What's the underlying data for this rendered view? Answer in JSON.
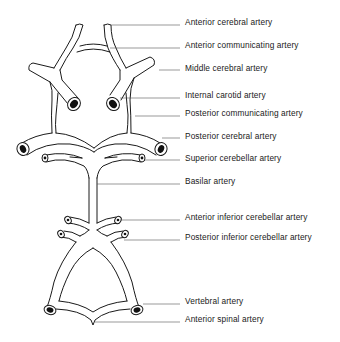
{
  "diagram": {
    "colors": {
      "line": "#1a1a1a",
      "leader": "#555555",
      "background": "#ffffff"
    },
    "labels": [
      {
        "id": "anterior-cerebral-artery",
        "text": "Anterior cerebral artery",
        "y": 17
      },
      {
        "id": "anterior-communicating-artery",
        "text": "Anterior communicating artery",
        "y": 40
      },
      {
        "id": "middle-cerebral-artery",
        "text": "Middle cerebral artery",
        "y": 63
      },
      {
        "id": "internal-carotid-artery",
        "text": "Internal carotid artery",
        "y": 90
      },
      {
        "id": "posterior-communicating-artery",
        "text": "Posterior communicating artery",
        "y": 108
      },
      {
        "id": "posterior-cerebral-artery",
        "text": "Posterior cerebral artery",
        "y": 131
      },
      {
        "id": "superior-cerebellar-artery",
        "text": "Superior cerebellar artery",
        "y": 153
      },
      {
        "id": "basilar-artery",
        "text": "Basilar artery",
        "y": 176
      },
      {
        "id": "anterior-inferior-cerebellar-artery",
        "text": "Anterior inferior cerebellar artery",
        "y": 212
      },
      {
        "id": "posterior-inferior-cerebellar-artery",
        "text": "Posterior inferior cerebellar artery",
        "y": 232
      },
      {
        "id": "vertebral-artery",
        "text": "Vertebral artery",
        "y": 296
      },
      {
        "id": "anterior-spinal-artery",
        "text": "Anterior spinal artery",
        "y": 314
      }
    ]
  }
}
